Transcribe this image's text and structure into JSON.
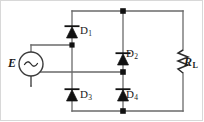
{
  "figure": {
    "name": "full-wave-bridge-rectifier",
    "width": 204,
    "height": 122,
    "background": "#ffffff",
    "line_color": "#595959",
    "symbol_color": "#111111",
    "border_color": "#d8d8d8"
  },
  "source": {
    "label": "E",
    "symbol": "ac-voltage-source",
    "glyph": "~"
  },
  "load": {
    "label": "R",
    "subscript": "L",
    "symbol": "resistor-zigzag"
  },
  "diodes": [
    {
      "id": "D1",
      "label": "D",
      "subscript": "1",
      "orientation": "up"
    },
    {
      "id": "D2",
      "label": "D",
      "subscript": "2",
      "orientation": "up"
    },
    {
      "id": "D3",
      "label": "D",
      "subscript": "3",
      "orientation": "up"
    },
    {
      "id": "D4",
      "label": "D",
      "subscript": "4",
      "orientation": "up"
    }
  ],
  "nodes": [
    {
      "name": "top-junction",
      "x": 123,
      "y": 11
    },
    {
      "name": "left-ac-node",
      "x": 72,
      "y": 45
    },
    {
      "name": "middle-junction",
      "x": 123,
      "y": 72
    },
    {
      "name": "bottom-junction",
      "x": 123,
      "y": 111
    }
  ]
}
